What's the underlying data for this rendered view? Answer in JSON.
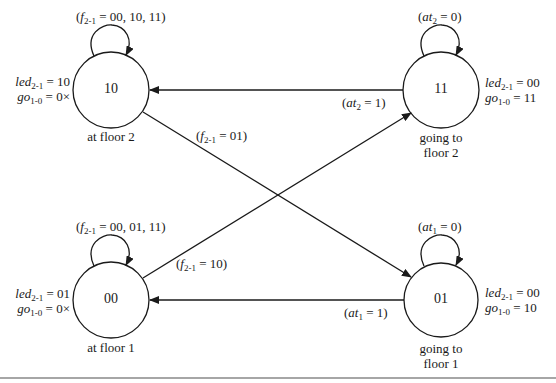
{
  "states": [
    {
      "id": "s10",
      "code": "10",
      "caption": [
        "at floor 2"
      ],
      "led": "10",
      "go": "0×",
      "self_loop": "00, 10, 11",
      "self_loop_var": "f",
      "self_loop_sub": "2-1"
    },
    {
      "id": "s11",
      "code": "11",
      "caption": [
        "going to",
        "floor 2"
      ],
      "led": "00",
      "go": "11",
      "self_loop": "0",
      "self_loop_var": "at",
      "self_loop_sub": "2"
    },
    {
      "id": "s00",
      "code": "00",
      "caption": [
        "at floor 1"
      ],
      "led": "01",
      "go": "0×",
      "self_loop": "00, 01, 11",
      "self_loop_var": "f",
      "self_loop_sub": "2-1"
    },
    {
      "id": "s01",
      "code": "01",
      "caption": [
        "going to",
        "floor 1"
      ],
      "led": "00",
      "go": "10",
      "self_loop": "0",
      "self_loop_var": "at",
      "self_loop_sub": "1"
    }
  ],
  "outputs": {
    "led_var": "led",
    "led_sub": "2-1",
    "go_var": "go",
    "go_sub": "1-0"
  },
  "transitions": [
    {
      "from": "11",
      "to": "10",
      "var": "at",
      "sub": "2",
      "value": "1"
    },
    {
      "from": "10",
      "to": "01",
      "var": "f",
      "sub": "2-1",
      "value": "01"
    },
    {
      "from": "00",
      "to": "11",
      "var": "f",
      "sub": "2-1",
      "value": "10"
    },
    {
      "from": "01",
      "to": "00",
      "var": "at",
      "sub": "1",
      "value": "1"
    }
  ],
  "colors": {
    "stroke": "#1a1a1a",
    "background": "#ffffff",
    "rule": "#888888"
  }
}
